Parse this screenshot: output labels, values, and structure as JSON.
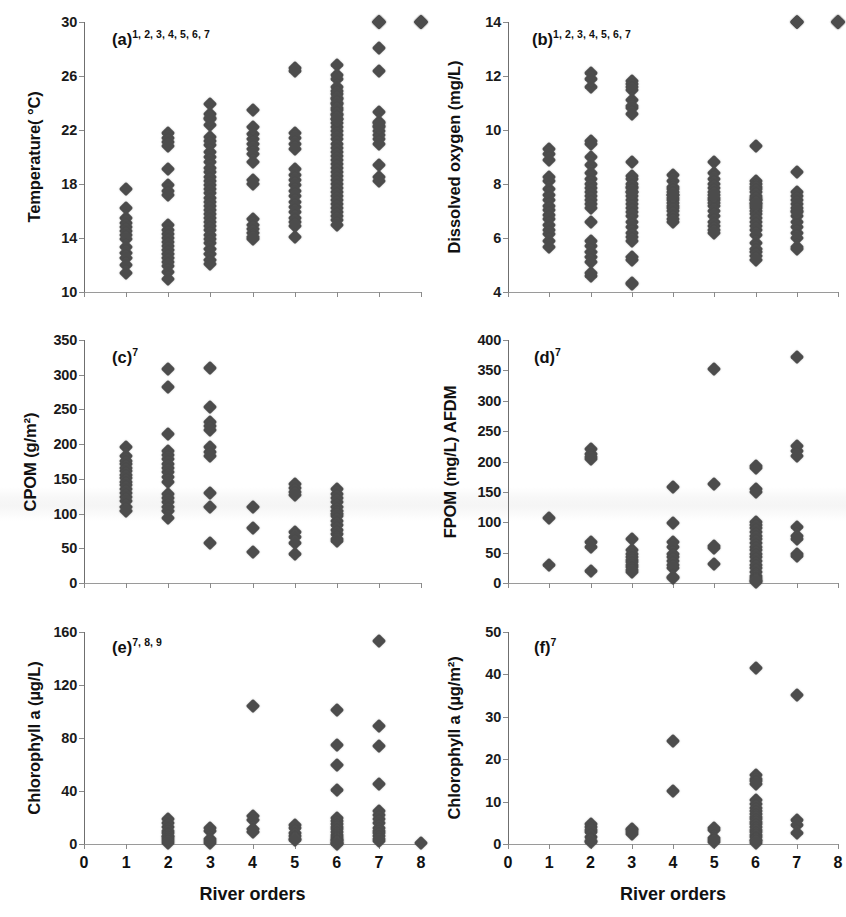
{
  "figure": {
    "marker_color": "#4c4c4c",
    "axis_color": "#8a8a8a",
    "xlabel": "River orders"
  },
  "chart_data": [
    {
      "id": "a",
      "type": "scatter",
      "panel_label": "(a)",
      "panel_superscript": "1, 2, 3, 4, 5, 6, 7",
      "title": "",
      "xlabel": "River orders",
      "ylabel": "Temperature( °C)",
      "xlim": [
        0,
        8
      ],
      "ylim": [
        10,
        30
      ],
      "xticks": [
        0,
        1,
        2,
        3,
        4,
        5,
        6,
        7,
        8
      ],
      "yticks": [
        10,
        14,
        18,
        22,
        26,
        30
      ],
      "xtick_labels_visible": false,
      "grid": false,
      "legend": "none",
      "x": [
        1,
        1,
        1,
        1,
        1,
        1,
        1,
        1,
        1,
        1,
        1,
        1,
        1,
        2,
        2,
        2,
        2,
        2,
        2,
        2,
        2,
        2,
        2,
        2,
        2,
        2,
        2,
        2,
        2,
        2,
        2,
        2,
        2,
        2,
        3,
        3,
        3,
        3,
        3,
        3,
        3,
        3,
        3,
        3,
        3,
        3,
        3,
        3,
        3,
        3,
        3,
        3,
        3,
        3,
        3,
        3,
        3,
        3,
        3,
        3,
        3,
        3,
        3,
        3,
        3,
        3,
        3,
        3,
        4,
        4,
        4,
        4,
        4,
        4,
        4,
        4,
        4,
        4,
        4,
        4,
        4,
        4,
        4,
        4,
        5,
        5,
        5,
        5,
        5,
        5,
        5,
        5,
        5,
        5,
        5,
        5,
        5,
        5,
        5,
        5,
        5,
        5,
        5,
        6,
        6,
        6,
        6,
        6,
        6,
        6,
        6,
        6,
        6,
        6,
        6,
        6,
        6,
        6,
        6,
        6,
        6,
        6,
        6,
        6,
        6,
        6,
        6,
        6,
        6,
        6,
        6,
        6,
        6,
        6,
        6,
        6,
        6,
        6,
        6,
        6,
        6,
        6,
        6,
        6,
        6,
        7,
        7,
        7,
        7,
        7,
        7,
        7,
        7,
        7,
        7,
        7,
        7,
        7,
        7,
        7,
        7,
        7,
        7,
        7,
        8,
        8,
        8,
        8,
        8
      ],
      "y": [
        17.6,
        16.2,
        15.5,
        15.1,
        14.8,
        14.5,
        14.2,
        13.9,
        13.3,
        12.9,
        12.5,
        12.0,
        11.4,
        21.8,
        21.4,
        21.1,
        20.8,
        19.1,
        17.9,
        17.5,
        17.2,
        15.0,
        14.6,
        14.3,
        14.0,
        13.7,
        13.4,
        13.1,
        12.8,
        12.5,
        12.2,
        11.9,
        11.5,
        11.0,
        23.9,
        23.2,
        22.8,
        22.4,
        21.5,
        21.2,
        20.9,
        20.4,
        20.0,
        19.6,
        19.2,
        18.9,
        18.5,
        18.2,
        17.9,
        17.6,
        17.3,
        17.0,
        16.7,
        16.4,
        16.1,
        15.8,
        15.5,
        15.2,
        14.9,
        14.6,
        14.2,
        13.9,
        13.6,
        13.2,
        12.8,
        12.4,
        12.1,
        22.9,
        21.7,
        21.3,
        21.0,
        20.6,
        20.2,
        19.6,
        18.3,
        18.0,
        15.4,
        15.0,
        14.7,
        14.4,
        14.1,
        13.9,
        23.5,
        22.2,
        21.8,
        21.4,
        21.0,
        20.6,
        19.1,
        18.7,
        18.3,
        17.9,
        17.5,
        17.1,
        16.7,
        16.3,
        15.9,
        15.5,
        15.2,
        14.9,
        14.1,
        26.6,
        26.4,
        26.1,
        25.8,
        24.9,
        24.4,
        24.0,
        23.6,
        23.2,
        22.8,
        22.5,
        22.2,
        21.9,
        21.6,
        21.3,
        21.0,
        20.7,
        20.4,
        20.1,
        19.8,
        19.5,
        19.2,
        18.9,
        18.6,
        18.3,
        18.0,
        17.7,
        17.4,
        17.1,
        16.8,
        16.5,
        16.2,
        15.9,
        15.6,
        15.3,
        15.0,
        26.8,
        25.2,
        24.7,
        24.3,
        23.9,
        23.5,
        23.1,
        22.8,
        22.5,
        22.2,
        21.9,
        21.6,
        21.3,
        21.0,
        19.4,
        18.5,
        18.2,
        28.1,
        26.4,
        23.3,
        22.6,
        22.3
      ],
      "values_note": "Temperature distributions by Strahler river order"
    },
    {
      "id": "b",
      "type": "scatter",
      "panel_label": "(b)",
      "panel_superscript": "1, 2, 3, 4, 5, 6, 7",
      "title": "",
      "xlabel": "River orders",
      "ylabel": "Dissolved oxygen (mg/L)",
      "xlim": [
        0,
        8
      ],
      "ylim": [
        4,
        14
      ],
      "xticks": [
        0,
        1,
        2,
        3,
        4,
        5,
        6,
        7,
        8
      ],
      "yticks": [
        4,
        6,
        8,
        10,
        12,
        14
      ],
      "xtick_labels_visible": false,
      "grid": false,
      "legend": "none",
      "x": [
        1,
        1,
        1,
        1,
        1,
        1,
        1,
        1,
        1,
        1,
        1,
        1,
        1,
        1,
        1,
        1,
        1,
        2,
        2,
        2,
        2,
        2,
        2,
        2,
        2,
        2,
        2,
        2,
        2,
        2,
        2,
        2,
        2,
        2,
        2,
        2,
        2,
        2,
        2,
        2,
        2,
        3,
        3,
        3,
        3,
        3,
        3,
        3,
        3,
        3,
        3,
        3,
        3,
        3,
        3,
        3,
        3,
        3,
        3,
        3,
        3,
        3,
        3,
        3,
        3,
        3,
        3,
        3,
        3,
        3,
        3,
        3,
        4,
        4,
        4,
        4,
        4,
        4,
        4,
        4,
        4,
        4,
        4,
        4,
        4,
        4,
        4,
        4,
        5,
        5,
        5,
        5,
        5,
        5,
        5,
        5,
        5,
        5,
        5,
        5,
        5,
        5,
        5,
        5,
        5,
        6,
        6,
        6,
        6,
        6,
        6,
        6,
        6,
        6,
        6,
        6,
        6,
        6,
        6,
        6,
        6,
        6,
        6,
        6,
        6,
        6,
        6,
        6,
        6,
        6,
        6,
        7,
        7,
        7,
        7,
        7,
        7,
        7,
        7,
        7,
        7,
        7,
        7,
        7,
        7,
        7,
        7,
        7,
        7,
        8,
        8,
        8,
        8,
        8,
        8
      ],
      "y": [
        9.3,
        9.1,
        8.9,
        8.25,
        8.1,
        7.8,
        7.6,
        7.4,
        7.2,
        7.05,
        6.85,
        6.7,
        6.5,
        6.3,
        6.15,
        5.9,
        5.65,
        11.6,
        9.6,
        9.5,
        9.0,
        8.7,
        8.4,
        8.2,
        8.0,
        7.85,
        7.7,
        7.55,
        7.4,
        7.25,
        7.1,
        6.6,
        5.9,
        5.7,
        5.5,
        5.3,
        5.1,
        4.7,
        4.6,
        12.1,
        11.9,
        11.8,
        11.7,
        11.6,
        11.5,
        11.1,
        10.9,
        10.8,
        10.6,
        8.3,
        7.9,
        7.7,
        7.55,
        7.4,
        7.25,
        7.1,
        6.95,
        6.8,
        6.6,
        6.4,
        6.2,
        6.05,
        5.9,
        5.3,
        5.2,
        4.35,
        4.3,
        8.8,
        8.2,
        8.0,
        7.85,
        7.7,
        7.6,
        7.5,
        7.4,
        7.3,
        7.2,
        7.1,
        7.0,
        6.85,
        6.7,
        6.6,
        8.35,
        8.1,
        7.9,
        7.8,
        7.7,
        7.6,
        7.5,
        7.4,
        7.3,
        7.2,
        7.0,
        6.8,
        6.6,
        6.45,
        6.3,
        6.2,
        8.8,
        8.4,
        8.2,
        8.0,
        7.85,
        7.7,
        7.6,
        7.5,
        7.4,
        7.3,
        7.2,
        7.1,
        7.0,
        6.9,
        6.75,
        6.6,
        6.45,
        6.3,
        6.1,
        5.8,
        5.6,
        5.5,
        5.35,
        5.2,
        9.4,
        8.1,
        8.0,
        7.9,
        7.8,
        7.7,
        7.55,
        7.4,
        7.25,
        7.1,
        6.95,
        6.8,
        6.6,
        6.4,
        6.2,
        6.0,
        5.65,
        5.6,
        8.45,
        7.7,
        7.55,
        7.4,
        7.25,
        7.0
      ],
      "values_note": "Dissolved oxygen distributions by river order"
    },
    {
      "id": "c",
      "type": "scatter",
      "panel_label": "(c)",
      "panel_superscript": "7",
      "title": "",
      "xlabel": "River orders",
      "ylabel": "CPOM (g/m²)",
      "xlim": [
        0,
        8
      ],
      "ylim": [
        0,
        350
      ],
      "xticks": [
        0,
        1,
        2,
        3,
        4,
        5,
        6,
        7,
        8
      ],
      "yticks": [
        0,
        50,
        100,
        150,
        200,
        250,
        300,
        350
      ],
      "xtick_labels_visible": false,
      "grid": false,
      "legend": "none",
      "x": [
        1,
        1,
        1,
        1,
        1,
        1,
        1,
        1,
        1,
        1,
        1,
        1,
        1,
        1,
        1,
        1,
        2,
        2,
        2,
        2,
        2,
        2,
        2,
        2,
        2,
        2,
        2,
        2,
        2,
        2,
        2,
        2,
        2,
        3,
        3,
        3,
        3,
        3,
        3,
        3,
        3,
        3,
        3,
        3,
        4,
        4,
        4,
        5,
        5,
        5,
        5,
        5,
        5,
        5,
        5,
        6,
        6,
        6,
        6,
        6,
        6,
        6,
        6,
        6,
        6,
        6,
        6,
        6,
        6
      ],
      "y": [
        196,
        183,
        176,
        171,
        166,
        161,
        156,
        151,
        146,
        141,
        136,
        130,
        124,
        118,
        110,
        103,
        308,
        282,
        215,
        190,
        184,
        178,
        172,
        166,
        160,
        153,
        146,
        128,
        122,
        116,
        110,
        103,
        93,
        310,
        253,
        232,
        226,
        221,
        196,
        189,
        183,
        130,
        109,
        58,
        109,
        79,
        45,
        143,
        137,
        131,
        127,
        74,
        66,
        58,
        42,
        136,
        128,
        122,
        116,
        110,
        104,
        100,
        96,
        90,
        84,
        76,
        70,
        64,
        61
      ],
      "values_note": "Coarse particulate organic matter by river order"
    },
    {
      "id": "d",
      "type": "scatter",
      "panel_label": "(d)",
      "panel_superscript": "7",
      "title": "",
      "xlabel": "River orders",
      "ylabel": "FPOM  (mg/L) AFDM",
      "xlim": [
        0,
        8
      ],
      "ylim": [
        0,
        400
      ],
      "xticks": [
        0,
        1,
        2,
        3,
        4,
        5,
        6,
        7,
        8
      ],
      "yticks": [
        0,
        50,
        100,
        150,
        200,
        250,
        300,
        350,
        400
      ],
      "xtick_labels_visible": false,
      "grid": false,
      "legend": "none",
      "x": [
        1,
        1,
        2,
        2,
        2,
        2,
        2,
        2,
        2,
        3,
        3,
        3,
        3,
        3,
        3,
        3,
        3,
        3,
        3,
        4,
        4,
        4,
        4,
        4,
        4,
        4,
        4,
        4,
        4,
        4,
        5,
        5,
        5,
        5,
        5,
        6,
        6,
        6,
        6,
        6,
        6,
        6,
        6,
        6,
        6,
        6,
        6,
        6,
        6,
        6,
        6,
        6,
        6,
        6,
        6,
        6,
        6,
        6,
        6,
        7,
        7,
        7,
        7,
        7,
        7,
        7,
        7,
        7
      ],
      "y": [
        107,
        30,
        221,
        213,
        208,
        204,
        67,
        59,
        19,
        72,
        55,
        47,
        42,
        38,
        34,
        30,
        26,
        22,
        18,
        158,
        98,
        68,
        60,
        48,
        42,
        36,
        30,
        24,
        10,
        8,
        352,
        163,
        61,
        58,
        32,
        193,
        190,
        155,
        150,
        100,
        96,
        90,
        84,
        78,
        72,
        66,
        60,
        54,
        48,
        42,
        36,
        30,
        24,
        18,
        12,
        8,
        5,
        3,
        2,
        372,
        225,
        217,
        209,
        92,
        78,
        72,
        48,
        45
      ],
      "values_note": "Fine particulate organic matter (AFDM) by river order"
    },
    {
      "id": "e",
      "type": "scatter",
      "panel_label": "(e)",
      "panel_superscript": "7, 8, 9",
      "title": "",
      "xlabel": "River orders",
      "ylabel": "Chlorophyll a (µg/L)",
      "xlim": [
        0,
        8
      ],
      "ylim": [
        0,
        160
      ],
      "xticks": [
        0,
        1,
        2,
        3,
        4,
        5,
        6,
        7,
        8
      ],
      "yticks": [
        0,
        40,
        80,
        120,
        160
      ],
      "xtick_labels_visible": true,
      "grid": false,
      "legend": "none",
      "x": [
        2,
        2,
        2,
        2,
        2,
        2,
        2,
        2,
        2,
        2,
        3,
        3,
        3,
        3,
        3,
        4,
        4,
        4,
        4,
        4,
        5,
        5,
        5,
        5,
        5,
        5,
        6,
        6,
        6,
        6,
        6,
        6,
        6,
        6,
        6,
        6,
        6,
        6,
        6,
        6,
        6,
        6,
        6,
        6,
        7,
        7,
        7,
        7,
        7,
        7,
        7,
        7,
        7,
        7,
        7,
        7,
        7,
        7,
        8
      ],
      "y": [
        19,
        16,
        13,
        10,
        8,
        6,
        5,
        4,
        2,
        1,
        12,
        10,
        4,
        2,
        1,
        104,
        21,
        18,
        11,
        9,
        14,
        12,
        8,
        6,
        4,
        3,
        101,
        75,
        60,
        41,
        20,
        17,
        15,
        13,
        11,
        9,
        7,
        5,
        4,
        3,
        2,
        1,
        0.5,
        0.3,
        153,
        89,
        74,
        45,
        25,
        22,
        19,
        16,
        12,
        10,
        8,
        6,
        4,
        2,
        0.5
      ],
      "values_note": "Planktonic chlorophyll a by river order"
    },
    {
      "id": "f",
      "type": "scatter",
      "panel_label": "(f)",
      "panel_superscript": "7",
      "title": "",
      "xlabel": "River orders",
      "ylabel": "Chlorophyll a (µg/m²)",
      "xlim": [
        0,
        8
      ],
      "ylim": [
        0,
        50
      ],
      "xticks": [
        0,
        1,
        2,
        3,
        4,
        5,
        6,
        7,
        8
      ],
      "yticks": [
        0,
        10,
        20,
        30,
        40,
        50
      ],
      "xtick_labels_visible": true,
      "grid": false,
      "legend": "none",
      "x": [
        2,
        2,
        2,
        2,
        2,
        2,
        2,
        3,
        3,
        3,
        3,
        4,
        4,
        5,
        5,
        5,
        5,
        5,
        6,
        6,
        6,
        6,
        6,
        6,
        6,
        6,
        6,
        6,
        6,
        6,
        6,
        6,
        6,
        6,
        6,
        6,
        6,
        6,
        6,
        6,
        7,
        7,
        7,
        7
      ],
      "y": [
        4.6,
        4.0,
        3.4,
        2.8,
        1.6,
        0.8,
        0.4,
        3.6,
        3.2,
        2.8,
        2.4,
        24.2,
        12.4,
        3.7,
        3.2,
        1.4,
        0.9,
        0.5,
        41.6,
        16.2,
        15.4,
        14.8,
        14.2,
        10.4,
        9.4,
        8.6,
        7.8,
        7.0,
        6.4,
        5.8,
        5.2,
        4.6,
        4.0,
        3.4,
        2.8,
        2.2,
        1.6,
        1.0,
        0.6,
        0.3,
        35.2,
        5.6,
        4.4,
        2.6
      ],
      "values_note": "Benthic chlorophyll a by river order"
    }
  ]
}
